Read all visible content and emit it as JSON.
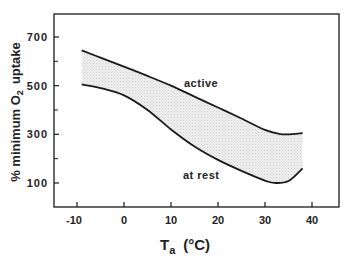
{
  "chart_data": {
    "type": "area",
    "title": "",
    "xlabel": "Ta (°C)",
    "xlabel_main": "T",
    "xlabel_sub": "a",
    "xlabel_unit": "(°C)",
    "ylabel": "% minimum O2 uptake",
    "ylabel_prefix": "% minimum O",
    "ylabel_sub": "2",
    "ylabel_suffix": "uptake",
    "xlim": [
      -15,
      45
    ],
    "ylim": [
      0,
      800
    ],
    "xticks": [
      -10,
      0,
      10,
      20,
      30,
      40
    ],
    "xtick_labels": [
      "-10",
      "0",
      "10",
      "20",
      "30",
      "40"
    ],
    "yticks": [
      100,
      300,
      500,
      700
    ],
    "ytick_labels": [
      "100",
      "300",
      "500",
      "700"
    ],
    "yminor_ticks": [
      200,
      400,
      600
    ],
    "grid": false,
    "legend": "inline labels",
    "series": [
      {
        "name": "active",
        "x": [
          -9,
          -5,
          0,
          5,
          10,
          15,
          20,
          25,
          30,
          33,
          35,
          38
        ],
        "values": [
          645,
          615,
          578,
          540,
          500,
          455,
          410,
          365,
          318,
          302,
          300,
          305
        ]
      },
      {
        "name": "at rest",
        "x": [
          -9,
          -5,
          0,
          5,
          10,
          15,
          20,
          25,
          30,
          32,
          35,
          38
        ],
        "values": [
          505,
          490,
          460,
          400,
          320,
          250,
          195,
          150,
          110,
          100,
          108,
          160
        ]
      }
    ],
    "fill_between": [
      "active",
      "at rest"
    ],
    "annotations": [
      {
        "text": "active",
        "x": 12,
        "y": 510
      },
      {
        "text": "at rest",
        "x": 15,
        "y": 130
      }
    ]
  },
  "colors": {
    "line": "#1a1a1a",
    "fill": "#e6e6e6",
    "frame": "#1a1a1a",
    "text": "#222222"
  }
}
